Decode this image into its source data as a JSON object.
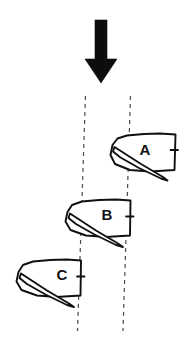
{
  "figure": {
    "type": "sailing-diagram",
    "background_color": "#ffffff",
    "ink_color": "#111111",
    "width": 183,
    "height": 351
  },
  "wind_arrow": {
    "name": "wind-direction-arrow",
    "direction": "down",
    "color": "#0d0d0d",
    "shaft": {
      "x_left": 95,
      "x_right": 107,
      "y_top": 20,
      "y_bottom": 59
    },
    "head": {
      "x_left": 85,
      "x_right": 117,
      "y_top": 59,
      "tip_x": 101,
      "tip_y": 83
    }
  },
  "laylines": {
    "color": "#4a4a4a",
    "dash": "4 4",
    "stroke_width": 1.2,
    "lines": [
      {
        "name": "left-layline",
        "x1": 85.5,
        "y1": 96,
        "x2": 77.5,
        "y2": 331
      },
      {
        "name": "right-layline",
        "x1": 130.5,
        "y1": 96,
        "x2": 123.0,
        "y2": 331
      }
    ]
  },
  "boats": [
    {
      "id": "A",
      "label": "A",
      "name": "boat-a",
      "label_x": 145,
      "label_y": 155,
      "hull": "M 112.5 145.0 L 117.5 138.5 L 127.0 135.5 L 144.0 134.0 L 160.0 133.5 L 175.5 134.5 L 174.5 170.0 L 150.0 171.5 L 130.0 170.0 L 115.0 164.0 L 110.5 155.0 Z",
      "sail": "M 114.5 147.0 L 141.0 164.0 L 163.0 177.0 L 167.5 180.5 L 161.0 178.5 L 139.0 168.0 L 120.5 157.5 L 113.0 151.5 Z",
      "tick": {
        "x1": 170.5,
        "y1": 150.0,
        "x2": 178.0,
        "y2": 150.0
      }
    },
    {
      "id": "B",
      "label": "B",
      "name": "boat-b",
      "label_x": 107,
      "label_y": 220,
      "hull": "M 67.5 212.0 L 72.0 205.0 L 82.0 201.5 L 99.0 200.0 L 116.0 199.5 L 130.5 200.5 L 130.0 235.5 L 106.0 237.0 L 86.0 235.5 L 70.5 230.0 L 65.5 221.5 Z",
      "sail": "M 70.0 213.5 L 96.0 230.5 L 118.0 243.5 L 123.0 247.0 L 116.0 245.0 L 94.5 234.5 L 76.0 224.0 L 68.5 218.0 Z",
      "tick": {
        "x1": 126.0,
        "y1": 216.5,
        "x2": 133.5,
        "y2": 216.5
      }
    },
    {
      "id": "C",
      "label": "C",
      "name": "boat-c",
      "label_x": 62,
      "label_y": 280,
      "hull": "M 18.5 272.0 L 23.0 265.0 L 33.0 261.5 L 50.0 260.0 L 66.5 259.5 L 81.0 260.5 L 80.5 295.5 L 56.5 297.0 L 37.0 295.5 L 21.5 290.0 L 16.5 281.5 Z",
      "sail": "M 21.0 273.5 L 47.0 290.5 L 69.0 303.5 L 74.0 307.0 L 67.0 305.0 L 45.5 294.5 L 27.0 284.0 L 19.5 278.0 Z",
      "tick": {
        "x1": 77.0,
        "y1": 276.5,
        "x2": 84.5,
        "y2": 276.5
      }
    }
  ]
}
